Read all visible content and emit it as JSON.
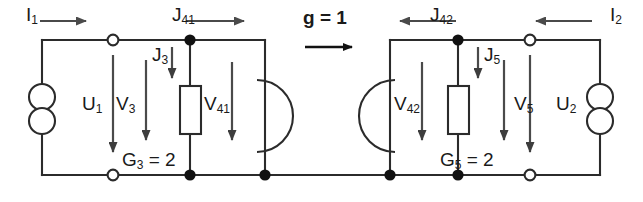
{
  "figure": {
    "type": "circuit-diagram",
    "stroke_color": "#2b2b2b",
    "text_color": "#1a1a1a",
    "background": "#ffffff",
    "width": 643,
    "height": 202
  },
  "labels": {
    "i1": {
      "base": "I",
      "sub": "1"
    },
    "i2": {
      "base": "I",
      "sub": "2"
    },
    "j41": {
      "base": "J",
      "sub": "41"
    },
    "j42": {
      "base": "J",
      "sub": "42"
    },
    "j3": {
      "base": "J",
      "sub": "3"
    },
    "j5": {
      "base": "J",
      "sub": "5"
    },
    "u1": {
      "base": "U",
      "sub": "1"
    },
    "u2": {
      "base": "U",
      "sub": "2"
    },
    "v3": {
      "base": "V",
      "sub": "3"
    },
    "v5": {
      "base": "V",
      "sub": "5"
    },
    "v41": {
      "base": "V",
      "sub": "41"
    },
    "v42": {
      "base": "V",
      "sub": "42"
    },
    "g3": {
      "base": "G",
      "sub": "3",
      "value": " = 2"
    },
    "g5": {
      "base": "G",
      "sub": "5",
      "value": " = 2"
    },
    "gain": "g = 1"
  },
  "components": [
    {
      "name": "source-u1",
      "kind": "double-circle-source",
      "port": 1
    },
    {
      "name": "source-u2",
      "kind": "double-circle-source",
      "port": 2
    },
    {
      "name": "resistor-g3",
      "kind": "rect-resistor",
      "conductance": 2
    },
    {
      "name": "resistor-g5",
      "kind": "rect-resistor",
      "conductance": 2
    },
    {
      "name": "controlled-source-left",
      "kind": "arc-source"
    },
    {
      "name": "controlled-source-right",
      "kind": "arc-source"
    }
  ],
  "terminals": {
    "open": 4,
    "filled_nodes": 6
  }
}
